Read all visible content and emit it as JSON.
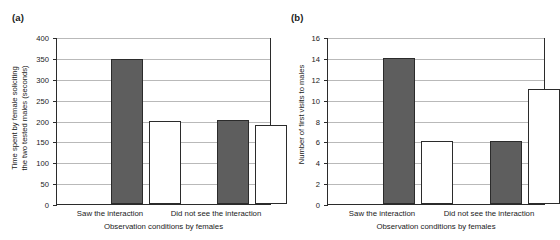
{
  "figure": {
    "background": "#ffffff",
    "axis_color": "#2b2b2b",
    "grid_color": "#b9b9b9",
    "dark_bar_color": "#5e5e5e",
    "light_bar_color": "#ffffff"
  },
  "panels": [
    {
      "label": "(a)",
      "ytitle_line1": "Time spent by female soliciting",
      "ytitle_line2": "the two tested males (seconds)",
      "xtitle": "Observation conditions by females",
      "categories": [
        "Saw the interaction",
        "Did not see the interaction"
      ],
      "yticks": [
        "0",
        "50",
        "100",
        "150",
        "200",
        "250",
        "300",
        "350",
        "400"
      ],
      "bars": [
        {
          "group": "Saw the interaction",
          "fill": "dark",
          "value": 348
        },
        {
          "group": "Saw the interaction",
          "fill": "light",
          "value": 198
        },
        {
          "group": "Did not see the interaction",
          "fill": "dark",
          "value": 202
        },
        {
          "group": "Did not see the interaction",
          "fill": "light",
          "value": 190
        }
      ]
    },
    {
      "label": "(b)",
      "ytitle_line1": "Number of first visits to males",
      "ytitle_line2": "",
      "xtitle": "Observation conditions by females",
      "categories": [
        "Saw the interaction",
        "Did not see the interaction"
      ],
      "yticks": [
        "0",
        "2",
        "4",
        "6",
        "8",
        "10",
        "12",
        "14",
        "16"
      ],
      "bars": [
        {
          "group": "Saw the interaction",
          "fill": "dark",
          "value": 14
        },
        {
          "group": "Saw the interaction",
          "fill": "light",
          "value": 6
        },
        {
          "group": "Did not see the interaction",
          "fill": "dark",
          "value": 6
        },
        {
          "group": "Did not see the interaction",
          "fill": "light",
          "value": 11
        }
      ]
    }
  ],
  "chart_data": [
    {
      "type": "bar",
      "title": "(a)",
      "xlabel": "Observation conditions by females",
      "ylabel": "Time spent by female soliciting the two tested males (seconds)",
      "categories": [
        "Saw the interaction",
        "Did not see the interaction"
      ],
      "series": [
        {
          "name": "dark bar (winner male)",
          "values": [
            348,
            202
          ]
        },
        {
          "name": "light bar (loser male)",
          "values": [
            198,
            190
          ]
        }
      ],
      "ylim": [
        0,
        400
      ],
      "ytick_step": 50,
      "grid": true,
      "legend": "none"
    },
    {
      "type": "bar",
      "title": "(b)",
      "xlabel": "Observation conditions by females",
      "ylabel": "Number of first visits to males",
      "categories": [
        "Saw the interaction",
        "Did not see the interaction"
      ],
      "series": [
        {
          "name": "dark bar (winner male)",
          "values": [
            14,
            6
          ]
        },
        {
          "name": "light bar (loser male)",
          "values": [
            6,
            11
          ]
        }
      ],
      "ylim": [
        0,
        16
      ],
      "ytick_step": 2,
      "grid": true,
      "legend": "none"
    }
  ]
}
